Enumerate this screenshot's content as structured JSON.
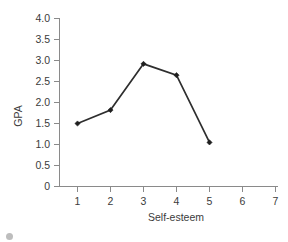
{
  "chart_data": {
    "type": "line",
    "title": "",
    "xlabel": "Self-esteem",
    "ylabel": "GPA",
    "x": [
      1,
      2,
      3,
      4,
      5
    ],
    "values": [
      1.5,
      1.82,
      2.92,
      2.65,
      1.05
    ],
    "series": [
      {
        "name": "GPA by self-esteem",
        "x": [
          1,
          2,
          3,
          4,
          5
        ],
        "values": [
          1.5,
          1.82,
          2.92,
          2.65,
          1.05
        ]
      }
    ],
    "xlim": [
      1,
      7
    ],
    "ylim": [
      0,
      4.0
    ],
    "xticks": [
      1,
      2,
      3,
      4,
      5,
      6,
      7
    ],
    "xtick_labels": [
      "1",
      "2",
      "3",
      "4",
      "5",
      "6",
      "7"
    ],
    "yticks": [
      0,
      0.5,
      1.0,
      1.5,
      2.0,
      2.5,
      3.0,
      3.5,
      4.0
    ],
    "ytick_labels": [
      "0",
      "0.5",
      "1.0",
      "1.5",
      "2.0",
      "2.5",
      "3.0",
      "3.5",
      "4.0"
    ],
    "grid": false,
    "legend": false,
    "legend_position": "none",
    "marker": "filled-diamond",
    "line_color": "#2e2e2e",
    "axis_color": "#8a8a8a",
    "background_color": "#ffffff",
    "annotations": []
  },
  "caption": {
    "text": ""
  }
}
